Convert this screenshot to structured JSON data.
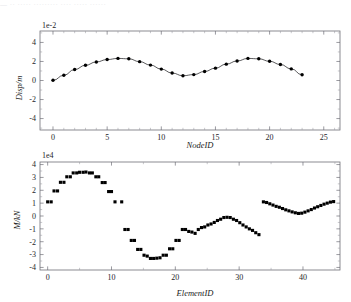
{
  "ghost_header": {
    "text": "— ·· ····· ········· ···· ····· ······"
  },
  "colors": {
    "background": "#ffffff",
    "axis": "#6f6f77",
    "marker": "#000000",
    "line": "#111114",
    "text": "#1a1a1a"
  },
  "chart_data": [
    {
      "id": "displacement",
      "type": "line",
      "title": "",
      "xlabel": "NodeID",
      "ylabel": "Disp/m",
      "exponent_label": "1e-2",
      "y_scale_factor": 0.01,
      "xlim": [
        -1.2,
        26.5
      ],
      "ylim": [
        -5.2,
        5.2
      ],
      "xticks": [
        0,
        5,
        10,
        15,
        20,
        25
      ],
      "yticks": [
        -4,
        -2,
        0,
        2,
        4
      ],
      "xtick_labels": [
        "0",
        "5",
        "10",
        "15",
        "20",
        "25"
      ],
      "ytick_labels": [
        "-4",
        "-2",
        "0",
        "2",
        "4"
      ],
      "minor_xticks": [
        1,
        2,
        3,
        4,
        6,
        7,
        8,
        9,
        11,
        12,
        13,
        14,
        16,
        17,
        18,
        19,
        21,
        22,
        23,
        24,
        26
      ],
      "minor_yticks": [
        -5,
        -3,
        -1,
        1,
        3,
        5
      ],
      "grid": false,
      "legend": null,
      "marker": "circle",
      "x": [
        0,
        1,
        2,
        3,
        4,
        5,
        6,
        7,
        8,
        9,
        10,
        11,
        12,
        13,
        14,
        15,
        16,
        17,
        18,
        19,
        20,
        21,
        22,
        23
      ],
      "values": [
        0.02,
        0.55,
        1.15,
        1.6,
        1.95,
        2.2,
        2.32,
        2.28,
        1.98,
        1.62,
        1.2,
        0.78,
        0.5,
        0.62,
        0.95,
        1.3,
        1.72,
        2.05,
        2.32,
        2.28,
        2.02,
        1.68,
        1.22,
        0.6
      ]
    },
    {
      "id": "moment",
      "type": "scatter",
      "title": "",
      "xlabel": "ElementID",
      "ylabel": "M/kN",
      "exponent_label": "1e4",
      "y_scale_factor": 10000,
      "xlim": [
        -1.2,
        45.8
      ],
      "ylim": [
        -4.2,
        4.2
      ],
      "xticks": [
        0,
        10,
        20,
        30,
        40
      ],
      "yticks": [
        -4,
        -3,
        -2,
        -1,
        0,
        1,
        2,
        3,
        4
      ],
      "xtick_labels": [
        "0",
        "10",
        "20",
        "30",
        "40"
      ],
      "ytick_labels": [
        "-4",
        "-3",
        "-2",
        "-1",
        "0",
        "1",
        "2",
        "3",
        "4"
      ],
      "minor_xticks": [
        5,
        15,
        25,
        35,
        45
      ],
      "minor_yticks": [
        -3.5,
        -2.5,
        -1.5,
        -0.5,
        0.5,
        1.5,
        2.5,
        3.5
      ],
      "grid": false,
      "legend": null,
      "marker": "square",
      "note": "values are plotted as paired step markers, two samples per element",
      "x": [
        0,
        0.55,
        1,
        1.55,
        2,
        2.55,
        3,
        3.55,
        4,
        4.55,
        5,
        5.55,
        6,
        6.55,
        7,
        7.55,
        8,
        8.55,
        9,
        9.55,
        10,
        10.55,
        11.6,
        12.1,
        12.6,
        13.1,
        13.6,
        14.1,
        14.6,
        15.1,
        15.6,
        16.1,
        16.6,
        17.1,
        17.6,
        18.1,
        18.6,
        19.1,
        19.6,
        20.1,
        20.6,
        21.1,
        21.6,
        22.1,
        22.6,
        23.1,
        23.6,
        24.1,
        24.6,
        25.1,
        25.6,
        26.1,
        26.6,
        27.1,
        27.6,
        28.1,
        28.6,
        29.1,
        29.6,
        30.1,
        30.6,
        31.1,
        31.6,
        32.1,
        32.6,
        33.1,
        33.8,
        34.3,
        34.8,
        35.3,
        35.8,
        36.3,
        36.8,
        37.3,
        37.8,
        38.3,
        38.8,
        39.3,
        39.8,
        40.3,
        40.8,
        41.3,
        41.8,
        42.3,
        42.8,
        43.3,
        43.8,
        44.3,
        44.8
      ],
      "values": [
        1.1,
        1.1,
        1.95,
        1.95,
        2.62,
        2.62,
        3.05,
        3.05,
        3.35,
        3.35,
        3.4,
        3.4,
        3.42,
        3.35,
        3.35,
        3.05,
        3.05,
        2.6,
        2.6,
        1.9,
        1.9,
        1.1,
        1.1,
        -1.05,
        -1.05,
        -1.9,
        -1.9,
        -2.6,
        -2.6,
        -3.05,
        -3.12,
        -3.3,
        -3.3,
        -3.28,
        -3.25,
        -3.05,
        -3.05,
        -2.55,
        -2.55,
        -1.9,
        -1.9,
        -1.05,
        -1.05,
        -1.2,
        -1.25,
        -1.35,
        -1.05,
        -0.9,
        -0.85,
        -0.7,
        -0.62,
        -0.5,
        -0.35,
        -0.25,
        -0.12,
        -0.1,
        -0.12,
        -0.25,
        -0.35,
        -0.52,
        -0.7,
        -0.85,
        -1.0,
        -1.12,
        -1.3,
        -1.45,
        1.1,
        1.05,
        0.95,
        0.85,
        0.75,
        0.68,
        0.58,
        0.48,
        0.4,
        0.32,
        0.25,
        0.2,
        0.22,
        0.3,
        0.4,
        0.5,
        0.62,
        0.72,
        0.82,
        0.92,
        1.0,
        1.08,
        1.12
      ]
    }
  ]
}
